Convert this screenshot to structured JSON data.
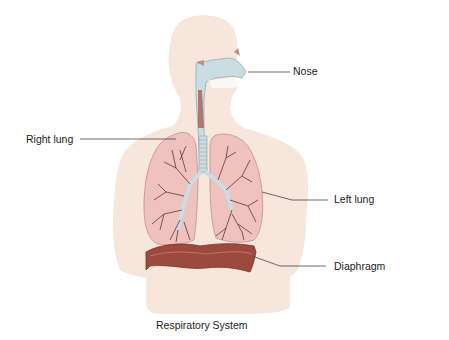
{
  "diagram": {
    "title": "Respiratory System",
    "labels": [
      {
        "id": "nose",
        "text": "Nose"
      },
      {
        "id": "right-lung",
        "text": "Right lung"
      },
      {
        "id": "left-lung",
        "text": "Left lung"
      },
      {
        "id": "diaphragm",
        "text": "Diaphragm"
      }
    ],
    "colors": {
      "body": "#f6e6dc",
      "lung": "#efc2c0",
      "lung_edge": "#c98a8a",
      "airway": "#c9dde3",
      "airway_edge": "#8aa6b0",
      "bronchi": "#5a3a30",
      "diaphragm": "#9c4a3e",
      "diaphragm_dark": "#7a3328",
      "leader_line": "#444444",
      "text": "#222222"
    }
  }
}
